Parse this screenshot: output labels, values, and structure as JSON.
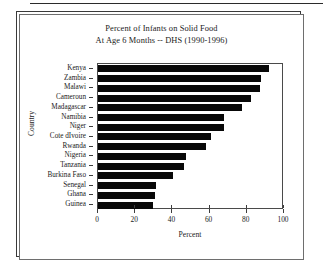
{
  "figure": {
    "title_line1": "Percent of Infants on Solid Food",
    "title_line2": "At Age 6 Months -- DHS (1990-1996)"
  },
  "chart_data": {
    "type": "bar",
    "orientation": "horizontal",
    "title": "Percent of Infants on Solid Food At Age 6 Months -- DHS (1990-1996)",
    "xlabel": "Percent",
    "ylabel": "Country",
    "xlim": [
      0,
      100
    ],
    "xticks": [
      0,
      20,
      40,
      60,
      80,
      100
    ],
    "xtick_labels": [
      "0",
      "20",
      "40",
      "60",
      "80",
      "100"
    ],
    "grid": false,
    "legend": null,
    "bar_color": "#080808",
    "categories": [
      "Kenya",
      "Zambia",
      "Malawi",
      "Cameroun",
      "Madagascar",
      "Namibia",
      "Niger",
      "Cote dIvoire",
      "Rwanda",
      "Nigeria",
      "Tanzania",
      "Burkina Faso",
      "Senegal",
      "Ghana",
      "Guinea"
    ],
    "values": [
      92,
      87.5,
      87,
      82,
      77.5,
      68,
      67.5,
      61,
      58,
      47.5,
      46.5,
      40.5,
      31,
      30.5,
      29.5
    ]
  }
}
